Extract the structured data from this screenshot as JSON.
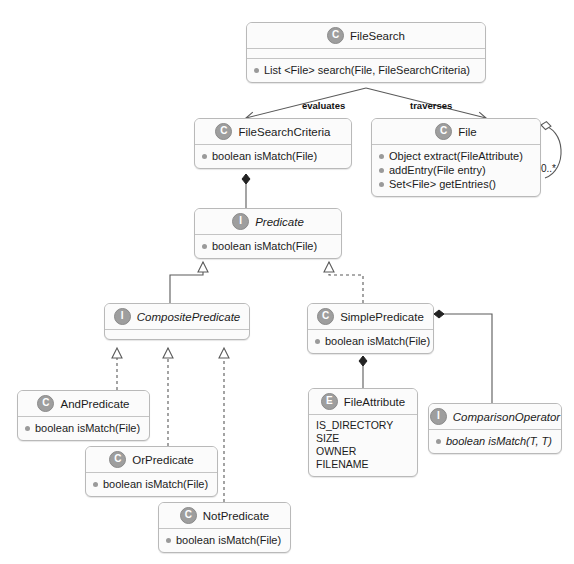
{
  "diagram": {
    "type": "uml-class-diagram",
    "canvas": {
      "width": 574,
      "height": 564,
      "background": "#ffffff"
    },
    "colors": {
      "node_fill": "#fbfbfb",
      "node_border": "#b9b9b9",
      "badge_fill": "#9e9e9e",
      "line": "#5a5a5a",
      "text": "#1b1b1b"
    }
  },
  "nodes": {
    "file_search": {
      "stereotype": "C",
      "name": "FileSearch",
      "kind": "class",
      "members": [
        "List <File> search(File, FileSearchCriteria)"
      ]
    },
    "file_search_criteria": {
      "stereotype": "C",
      "name": "FileSearchCriteria",
      "kind": "class",
      "members": [
        "boolean isMatch(File)"
      ]
    },
    "file": {
      "stereotype": "C",
      "name": "File",
      "kind": "class",
      "members": [
        "Object extract(FileAttribute)",
        "addEntry(File entry)",
        "Set<File> getEntries()"
      ]
    },
    "predicate": {
      "stereotype": "I",
      "name": "Predicate",
      "kind": "interface",
      "members": [
        "boolean isMatch(File)"
      ]
    },
    "composite_predicate": {
      "stereotype": "I",
      "name": "CompositePredicate",
      "kind": "interface",
      "members": []
    },
    "simple_predicate": {
      "stereotype": "C",
      "name": "SimplePredicate",
      "kind": "class",
      "members": [
        "boolean isMatch(File)"
      ]
    },
    "and_predicate": {
      "stereotype": "C",
      "name": "AndPredicate",
      "kind": "class",
      "members": [
        "boolean isMatch(File)"
      ]
    },
    "or_predicate": {
      "stereotype": "C",
      "name": "OrPredicate",
      "kind": "class",
      "members": [
        "boolean isMatch(File)"
      ]
    },
    "not_predicate": {
      "stereotype": "C",
      "name": "NotPredicate",
      "kind": "class",
      "members": [
        "boolean isMatch(File)"
      ]
    },
    "file_attribute": {
      "stereotype": "E",
      "name": "FileAttribute",
      "kind": "enum",
      "constants": [
        "IS_DIRECTORY",
        "SIZE",
        "OWNER",
        "FILENAME"
      ]
    },
    "comparison_operator": {
      "stereotype": "I",
      "name": "ComparisonOperator",
      "kind": "interface",
      "members": [
        "boolean isMatch(T, T)"
      ]
    }
  },
  "edges": {
    "evaluates_label": "evaluates",
    "traverses_label": "traverses",
    "file_self_multiplicity": "0..*"
  }
}
